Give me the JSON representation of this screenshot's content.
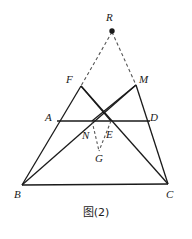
{
  "figure": {
    "caption": "图(2)",
    "stroke_color": "#1a1a1a",
    "dash_color": "#555555",
    "background": "#ffffff",
    "width": 192,
    "height": 239,
    "points": {
      "R": {
        "label": "R",
        "x": 112,
        "y": 31,
        "label_x": 106,
        "label_y": 12,
        "marker": "filled-dot"
      },
      "F": {
        "label": "F",
        "x": 81,
        "y": 86,
        "label_x": 66,
        "label_y": 74,
        "marker": "none"
      },
      "M": {
        "label": "M",
        "x": 136,
        "y": 85,
        "label_x": 139,
        "label_y": 74,
        "marker": "none"
      },
      "A": {
        "label": "A",
        "x": 62,
        "y": 121,
        "label_x": 45,
        "label_y": 112,
        "marker": "none"
      },
      "D": {
        "label": "D",
        "x": 148,
        "y": 121,
        "label_x": 150,
        "label_y": 112,
        "marker": "none"
      },
      "N": {
        "label": "N",
        "x": 92,
        "y": 121,
        "label_x": 83,
        "label_y": 131,
        "marker": "none"
      },
      "E": {
        "label": "E",
        "x": 111,
        "y": 121,
        "label_x": 106,
        "label_y": 130,
        "marker": "none"
      },
      "G": {
        "label": "G",
        "x": 99,
        "y": 152,
        "label_x": 95,
        "label_y": 155,
        "marker": "none"
      },
      "B": {
        "label": "B",
        "x": 22,
        "y": 185,
        "label_x": 15,
        "label_y": 190,
        "marker": "none"
      },
      "C": {
        "label": "C",
        "x": 168,
        "y": 184,
        "label_x": 167,
        "label_y": 190,
        "marker": "none"
      }
    },
    "solid_segments": [
      {
        "name": "segment-BC",
        "from": "B",
        "to": "C"
      },
      {
        "name": "segment-AD",
        "from": "A",
        "to": "D"
      },
      {
        "name": "segment-BF",
        "from": "B",
        "to": "F"
      },
      {
        "name": "segment-BM",
        "from": "B",
        "to": "M"
      },
      {
        "name": "segment-CM",
        "from": "C",
        "to": "M"
      },
      {
        "name": "segment-CF",
        "from": "C",
        "to": "F"
      },
      {
        "name": "segment-FE",
        "from": "F",
        "to": "E"
      },
      {
        "name": "segment-MN",
        "from": "M",
        "to": "N"
      }
    ],
    "dashed_segments": [
      {
        "name": "segment-RF",
        "from": "R",
        "to": "F"
      },
      {
        "name": "segment-RM",
        "from": "R",
        "to": "M"
      },
      {
        "name": "segment-NG",
        "from": "N",
        "to": "G"
      },
      {
        "name": "segment-EG",
        "from": "E",
        "to": "G"
      }
    ]
  }
}
